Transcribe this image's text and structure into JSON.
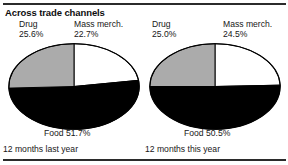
{
  "chart_title": "Across trade channels",
  "colors": {
    "drug": "#ababab",
    "mass_merch": "#ffffff",
    "food": "#000000",
    "outline": "#000000",
    "rule": "#2b2b2b",
    "text": "#171717"
  },
  "panels": [
    {
      "id": "last-year",
      "period_label": "12 months last year",
      "labels": {
        "drug_name": "Drug",
        "drug_pct": "25.6%",
        "mass_name": "Mass merch.",
        "mass_pct": "22.7%",
        "food": "Food 51.7%"
      }
    },
    {
      "id": "this-year",
      "period_label": "12 months this year",
      "labels": {
        "drug_name": "Drug",
        "drug_pct": "25.0%",
        "mass_name": "Mass merch.",
        "mass_pct": "24.5%",
        "food": "Food 50.5%"
      }
    }
  ],
  "chart_data": [
    {
      "type": "pie",
      "title": "12 months last year",
      "categories": [
        "Mass merch.",
        "Food",
        "Drug"
      ],
      "values": [
        22.7,
        51.7,
        25.6
      ],
      "labels": [
        "Mass merch. 22.7%",
        "Food 51.7%",
        "Drug 25.6%"
      ],
      "colors": [
        "#ffffff",
        "#000000",
        "#ababab"
      ],
      "units": "percent",
      "start_angle_deg": 0,
      "direction": "clockwise",
      "legend": "inline-labels"
    },
    {
      "type": "pie",
      "title": "12 months this year",
      "categories": [
        "Mass merch.",
        "Food",
        "Drug"
      ],
      "values": [
        24.5,
        50.5,
        25.0
      ],
      "labels": [
        "Mass merch. 24.5%",
        "Food 50.5%",
        "Drug 25.0%"
      ],
      "colors": [
        "#ffffff",
        "#000000",
        "#ababab"
      ],
      "units": "percent",
      "start_angle_deg": 0,
      "direction": "clockwise",
      "legend": "inline-labels"
    }
  ]
}
